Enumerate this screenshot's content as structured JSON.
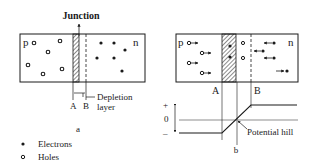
{
  "figure_a": {
    "junction_label": "Junction",
    "p_label": "p",
    "n_label": "n",
    "a_label": "A",
    "b_label": "B",
    "depletion_label_line1": "Depletion",
    "depletion_label_line2": "layer",
    "caption": "a"
  },
  "figure_b": {
    "p_label": "p",
    "n_label": "n",
    "a_label": "A",
    "b_label": "B",
    "plus_label": "+",
    "zero_label": "0",
    "minus_label": "–",
    "potential_label": "Potential hill",
    "caption": "b"
  },
  "legend": {
    "electrons_label": "Electrons",
    "holes_label": "Holes"
  },
  "colors": {
    "ink": "#1a1a1a",
    "background": "#ffffff"
  }
}
